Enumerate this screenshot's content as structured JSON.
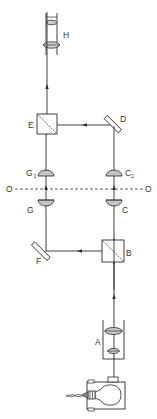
{
  "diagram": {
    "title": "",
    "type": "optical-interferometer-schematic",
    "colors": {
      "line": "#2a2a2a",
      "lens_fill": "#bfbfbf",
      "background": "#ffffff"
    },
    "labels": {
      "H": "H",
      "E": "E",
      "D": "D",
      "G1_main": "G",
      "G1_sub": "1",
      "C1_main": "C",
      "C1_sub": "1",
      "O_left": "O",
      "O_right": "O",
      "G": "G",
      "C": "C",
      "F": "F",
      "B": "B",
      "A": "A"
    },
    "components": [
      {
        "id": "lamp",
        "kind": "light-source-bulb"
      },
      {
        "id": "A",
        "kind": "condenser-lens-tube"
      },
      {
        "id": "B",
        "kind": "beam-splitter-cube"
      },
      {
        "id": "F",
        "kind": "plane-mirror"
      },
      {
        "id": "C",
        "kind": "objective-lens"
      },
      {
        "id": "C1",
        "kind": "objective-lens"
      },
      {
        "id": "G",
        "kind": "objective-lens"
      },
      {
        "id": "G1",
        "kind": "objective-lens"
      },
      {
        "id": "O",
        "kind": "object-plane-dashed"
      },
      {
        "id": "D",
        "kind": "plane-mirror"
      },
      {
        "id": "E",
        "kind": "beam-combiner-cube"
      },
      {
        "id": "H",
        "kind": "eyepiece-tube"
      }
    ]
  }
}
